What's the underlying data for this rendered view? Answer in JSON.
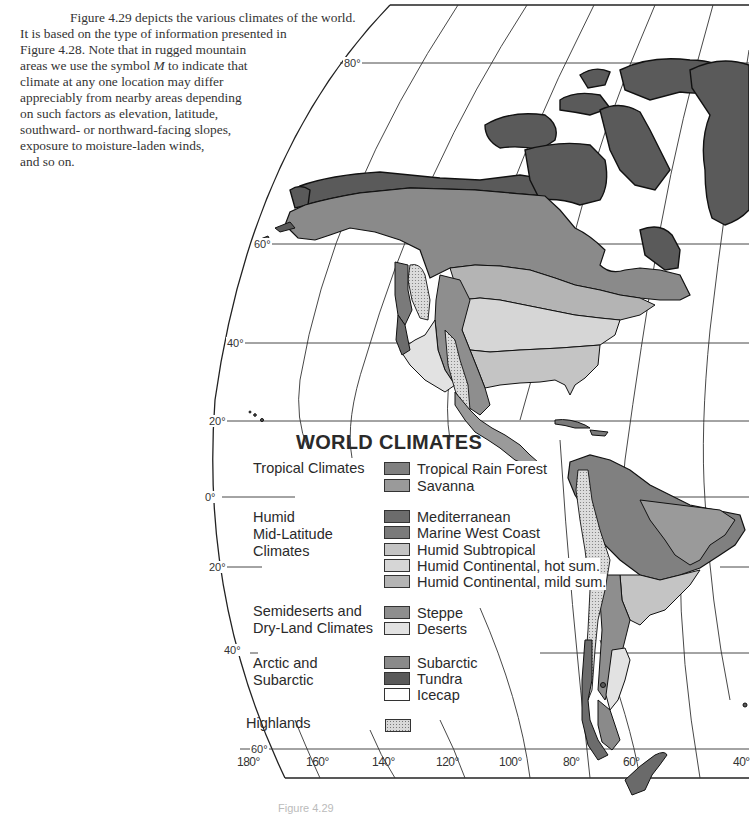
{
  "intro": {
    "lines": [
      "Figure 4.29 depicts the various climates of the world.",
      "It is based on the type of information presented in",
      "Figure 4.28. Note that in rugged mountain",
      "areas we use the symbol M to indicate that",
      "climate at any one location may differ",
      "appreciably from nearby areas depending",
      "on such factors as elevation, latitude,",
      "southward- or northward-facing slopes,",
      "exposure to moisture-laden winds,",
      "and so on."
    ],
    "symbol": "M"
  },
  "map": {
    "latitude_labels": [
      "80°",
      "60°",
      "40°",
      "20°",
      "0°",
      "20°",
      "40°",
      "60°"
    ],
    "longitude_labels": [
      "180°",
      "160°",
      "140°",
      "120°",
      "100°",
      "80°",
      "60°",
      "40°"
    ],
    "colors": {
      "tundra": "#5a5a5a",
      "subarctic": "#8a8a8a",
      "mediterranean": "#6c6c6c",
      "marine_west_coast": "#7a7a7a",
      "humid_subtropical": "#c4c4c4",
      "humid_continental_hot": "#d6d6d6",
      "humid_continental_mild": "#b4b4b4",
      "steppe": "#8e8e8e",
      "deserts": "#e2e2e2",
      "tropical_rain_forest": "#808080",
      "savanna": "#9a9a9a",
      "icecap": "#ffffff",
      "highlands": "#d8d8d8"
    }
  },
  "legend": {
    "title": "WORLD CLIMATES",
    "groups": [
      {
        "label_lines": [
          "Tropical Climates"
        ],
        "items": [
          {
            "label": "Tropical Rain Forest",
            "color": "#808080"
          },
          {
            "label": "Savanna",
            "color": "#9a9a9a"
          }
        ]
      },
      {
        "label_lines": [
          "Humid",
          "Mid-Latitude",
          "Climates"
        ],
        "items": [
          {
            "label": "Mediterranean",
            "color": "#6c6c6c"
          },
          {
            "label": "Marine West Coast",
            "color": "#7a7a7a"
          },
          {
            "label": "Humid Subtropical",
            "color": "#c4c4c4"
          },
          {
            "label": "Humid Continental, hot sum.",
            "color": "#d6d6d6"
          },
          {
            "label": "Humid Continental, mild sum.",
            "color": "#b4b4b4"
          }
        ]
      },
      {
        "label_lines": [
          "Semideserts and",
          "Dry-Land Climates"
        ],
        "items": [
          {
            "label": "Steppe",
            "color": "#8e8e8e"
          },
          {
            "label": "Deserts",
            "color": "#e2e2e2"
          }
        ]
      },
      {
        "label_lines": [
          "Arctic and",
          "Subarctic"
        ],
        "items": [
          {
            "label": "Subarctic",
            "color": "#8a8a8a"
          },
          {
            "label": "Tundra",
            "color": "#5a5a5a"
          },
          {
            "label": "Icecap",
            "color": "#ffffff"
          }
        ]
      },
      {
        "label_lines": [
          "Highlands"
        ],
        "items": [
          {
            "label": "",
            "color": "dotted"
          }
        ]
      }
    ]
  },
  "caption": "Figure 4.29"
}
